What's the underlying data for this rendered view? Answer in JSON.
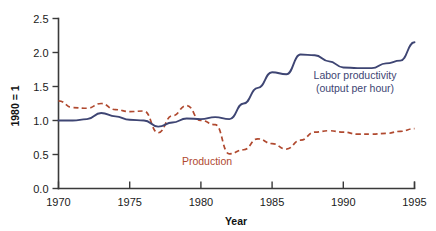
{
  "chart_data": {
    "type": "line",
    "title": "",
    "xlabel": "Year",
    "ylabel": "1980 = 1",
    "xlim": [
      1970,
      1995
    ],
    "ylim": [
      0.0,
      2.5
    ],
    "xticks": [
      1970,
      1975,
      1980,
      1985,
      1990,
      1995
    ],
    "xtick_labels": [
      "1970",
      "1975",
      "1980",
      "1985",
      "1990",
      "1995"
    ],
    "yticks": [
      0.0,
      0.5,
      1.0,
      1.5,
      2.0,
      2.5
    ],
    "ytick_labels": [
      "0.0",
      "0.5",
      "1.0",
      "1.5",
      "2.0",
      "2.5"
    ],
    "grid": false,
    "legend_position": "inline-annotations",
    "x": [
      1970,
      1971,
      1972,
      1973,
      1974,
      1975,
      1976,
      1977,
      1978,
      1979,
      1980,
      1981,
      1982,
      1983,
      1984,
      1985,
      1986,
      1987,
      1988,
      1989,
      1990,
      1991,
      1992,
      1993,
      1994,
      1995
    ],
    "series": [
      {
        "name": "Labor productivity (output per hour)",
        "style": "solid",
        "color": "#3e4573",
        "annotation": "Labor productivity\n(output per hour)",
        "values": [
          1.0,
          1.0,
          1.02,
          1.11,
          1.06,
          1.01,
          1.0,
          0.91,
          0.97,
          1.03,
          1.02,
          1.05,
          1.02,
          1.25,
          1.48,
          1.71,
          1.68,
          1.97,
          1.96,
          1.87,
          1.78,
          1.77,
          1.77,
          1.84,
          1.88,
          2.15
        ]
      },
      {
        "name": "Production",
        "style": "dashed",
        "color": "#b0492f",
        "annotation": "Production",
        "values": [
          1.29,
          1.19,
          1.18,
          1.25,
          1.16,
          1.13,
          1.14,
          0.82,
          1.07,
          1.22,
          1.0,
          0.94,
          0.51,
          0.57,
          0.73,
          0.66,
          0.58,
          0.71,
          0.83,
          0.85,
          0.83,
          0.8,
          0.8,
          0.81,
          0.84,
          0.88
        ]
      }
    ],
    "annotations": [
      {
        "name": "labor-productivity-label",
        "line1": "Labor productivity",
        "line2": "(output per hour)",
        "color": "#3e4573"
      },
      {
        "name": "production-label",
        "line1": "Production",
        "color": "#b0492f"
      }
    ]
  },
  "axes": {
    "x_title": "Year",
    "y_title": "1980 = 1"
  }
}
